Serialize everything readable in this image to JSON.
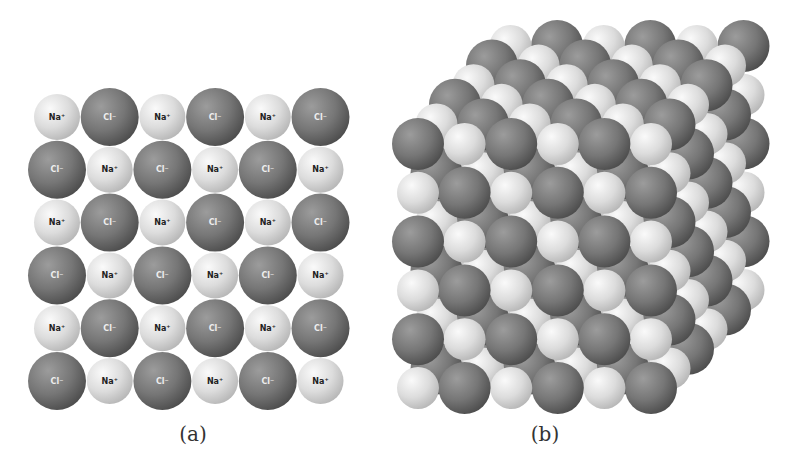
{
  "figure": {
    "panels": [
      {
        "id": "a",
        "caption": "(a)",
        "type": "2d-lattice",
        "rows": 6,
        "cols": 6,
        "first_ion": "Na",
        "origin": {
          "x": 57,
          "y": 117
        },
        "spacing": {
          "x": 52.7,
          "y": 52.8
        }
      },
      {
        "id": "b",
        "caption": "(b)",
        "type": "3d-lattice",
        "rows": 6,
        "cols": 6,
        "layers": 6,
        "first_ion": "Cl",
        "origin": {
          "x": 418,
          "y": 144
        },
        "spacing": {
          "x": 46.6,
          "y": 48.8
        },
        "depth_offset": {
          "x": 18.5,
          "y": -19.6
        }
      }
    ],
    "ions": {
      "Na": {
        "label": "Na⁺",
        "radius_2d": 23,
        "radius_3d": 21,
        "color_light": "#fafafa",
        "color_mid": "#dcdcdc",
        "color_dark": "#b8b8b8"
      },
      "Cl": {
        "label": "Cl⁻",
        "radius_2d": 29,
        "radius_3d": 26,
        "color_light": "#9a9a9a",
        "color_mid": "#767676",
        "color_dark": "#4e4e4e"
      }
    },
    "captions": {
      "a": "(a)",
      "b": "(b)"
    }
  }
}
